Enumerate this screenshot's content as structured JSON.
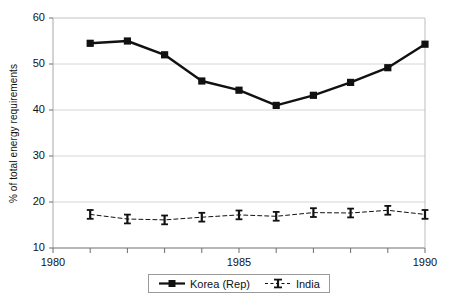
{
  "chart_data": {
    "type": "line",
    "title": "",
    "xlabel": "",
    "ylabel": "% of total energy requirements",
    "xlim": [
      1980,
      1990
    ],
    "ylim": [
      10,
      60
    ],
    "ytick_values": [
      10,
      20,
      30,
      40,
      50,
      60
    ],
    "ytick_labels": [
      "10",
      "20",
      "30",
      "40",
      "50",
      "60"
    ],
    "xtick_values": [
      1980,
      1981,
      1982,
      1983,
      1984,
      1985,
      1986,
      1987,
      1988,
      1989,
      1990
    ],
    "xtick_labels": [
      "1980",
      "",
      "",
      "",
      "",
      "1985",
      "",
      "",
      "",
      "",
      "1990"
    ],
    "visible_xtick_labels": [
      "1980",
      "1985",
      "1990"
    ],
    "grid": "horizontal",
    "legend_position": "bottom-center",
    "x": [
      1981,
      1982,
      1983,
      1984,
      1985,
      1986,
      1987,
      1988,
      1989,
      1990
    ],
    "series": [
      {
        "name": "Korea (Rep)",
        "marker": "filled-square",
        "line_style": "solid",
        "color": "#111111",
        "values": [
          54.5,
          55.0,
          52.0,
          46.3,
          44.3,
          41.0,
          43.2,
          46.0,
          49.2,
          54.3
        ]
      },
      {
        "name": "India",
        "marker": "i-beam",
        "line_style": "dashed",
        "color": "#111111",
        "values": [
          17.3,
          16.3,
          16.1,
          16.7,
          17.2,
          16.9,
          17.7,
          17.6,
          18.2,
          17.3
        ]
      }
    ]
  },
  "legend": {
    "items": [
      {
        "label": "Korea (Rep)"
      },
      {
        "label": "India"
      }
    ]
  },
  "axes": {
    "y_title": "% of total energy requirements"
  }
}
